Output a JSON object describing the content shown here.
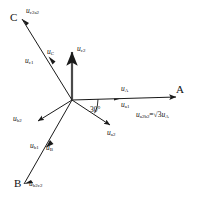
{
  "figure": {
    "type": "phasor-diagram",
    "title": "",
    "origin": {
      "x": 72,
      "y": 100
    },
    "stroke_color": "#1a1a1a",
    "background": "#ffffff"
  },
  "nodes": [
    {
      "id": "A",
      "label": "A",
      "x": 182,
      "y": 90
    },
    {
      "id": "B",
      "label": "B",
      "x": 17,
      "y": 180
    },
    {
      "id": "C",
      "label": "C",
      "x": 13,
      "y": 14
    }
  ],
  "vectors": [
    {
      "id": "uA",
      "base": "u",
      "sub": "A",
      "x1": 72,
      "y1": 100,
      "x2": 176,
      "y2": 97,
      "label_x": 124,
      "label_y": 85
    },
    {
      "id": "ua1",
      "base": "u",
      "sub": "a1",
      "x1": 72,
      "y1": 100,
      "x2": 176,
      "y2": 97,
      "label_x": 124,
      "label_y": 99
    },
    {
      "id": "ua2",
      "base": "u",
      "sub": "a2",
      "x1": 72,
      "y1": 100,
      "x2": 113,
      "y2": 127,
      "label_x": 110,
      "label_y": 130
    },
    {
      "id": "uc2",
      "base": "u",
      "sub": "c2",
      "x1": 72,
      "y1": 100,
      "x2": 72,
      "y2": 49,
      "label_x": 78,
      "label_y": 46
    },
    {
      "id": "uc1",
      "base": "u",
      "sub": "c1",
      "x1": 72,
      "y1": 100,
      "x2": 22,
      "y2": 19,
      "label_x": 34,
      "label_y": 57
    },
    {
      "id": "uC",
      "base": "u",
      "sub": "C",
      "x1": 72,
      "y1": 100,
      "x2": 47,
      "y2": 58,
      "label_x": 50,
      "label_y": 50
    },
    {
      "id": "ub2",
      "base": "u",
      "sub": "b2",
      "x1": 72,
      "y1": 100,
      "x2": 35,
      "y2": 123,
      "label_x": 15,
      "label_y": 117
    },
    {
      "id": "ub1",
      "base": "u",
      "sub": "b1",
      "x1": 72,
      "y1": 100,
      "x2": 24,
      "y2": 184,
      "label_x": 33,
      "label_y": 142
    },
    {
      "id": "uB",
      "base": "u",
      "sub": "B",
      "x1": 72,
      "y1": 100,
      "x2": 47,
      "y2": 144,
      "label_x": 47,
      "label_y": 145
    },
    {
      "id": "uc2a2",
      "base": "u",
      "sub": "c2a2",
      "x1": 30,
      "y1": 18,
      "x2": 30,
      "y2": 18,
      "label_x": 29,
      "label_y": 9
    },
    {
      "id": "ub2c2",
      "base": "u",
      "sub": "b2c2",
      "x1": 30,
      "y1": 186,
      "x2": 30,
      "y2": 186,
      "label_x": 30,
      "label_y": 181
    }
  ],
  "angle": {
    "label": "30",
    "unit": "°",
    "value_deg": 30,
    "x": 93,
    "y": 104,
    "arc_radius": 26
  },
  "equation": {
    "lhs_base": "u",
    "lhs_sub": "a2b2",
    "operator": "=",
    "coefficient": "3",
    "radical": "√",
    "rhs_base": "u",
    "rhs_sub": "A",
    "x": 137,
    "y": 112,
    "full_text": "u_a2b2 = √3 u_A"
  }
}
